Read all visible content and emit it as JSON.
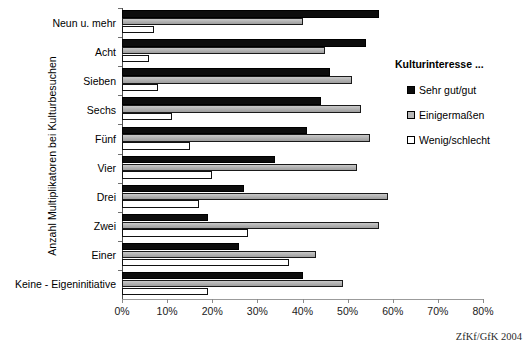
{
  "chart_data": {
    "type": "bar",
    "orientation": "horizontal",
    "title": "",
    "xlabel": "",
    "ylabel": "Anzahl Multiplikatoren bei Kulturbesuchen",
    "xlim": [
      0,
      80
    ],
    "xtick_labels": [
      "0%",
      "10%",
      "20%",
      "30%",
      "40%",
      "50%",
      "60%",
      "70%",
      "80%"
    ],
    "xtick_values": [
      0,
      10,
      20,
      30,
      40,
      50,
      60,
      70,
      80
    ],
    "grid": false,
    "legend_position": "right",
    "legend_title": "Kulturinteresse ...",
    "categories": [
      "Neun u. mehr",
      "Acht",
      "Sieben",
      "Sechs",
      "Fünf",
      "Vier",
      "Drei",
      "Zwei",
      "Einer",
      "Keine - Eigeninitiative"
    ],
    "series": [
      {
        "name": "Sehr gut/gut",
        "color": "#0d0d0d",
        "values": [
          57,
          54,
          46,
          44,
          41,
          34,
          27,
          19,
          26,
          40
        ]
      },
      {
        "name": "Einigermaßen",
        "color": "#b8b8b8",
        "values": [
          40,
          45,
          51,
          53,
          55,
          52,
          59,
          57,
          43,
          49
        ]
      },
      {
        "name": "Wenig/schlecht",
        "color": "#ffffff",
        "values": [
          7,
          6,
          8,
          11,
          15,
          20,
          17,
          28,
          37,
          19
        ]
      }
    ],
    "source_note": "ZfKf/GfK 2004"
  }
}
